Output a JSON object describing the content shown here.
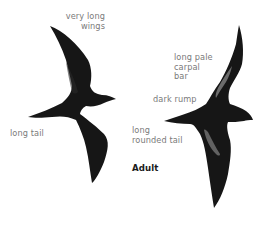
{
  "figure": {
    "caption": "Adult",
    "colors": {
      "background": "#ffffff",
      "bird_body": "#161616",
      "carpal_bar": "#8a8a8a",
      "label_text": "#7a7a7a",
      "caption_text": "#1a1a1a"
    },
    "birds": [
      {
        "view": "upperside-left",
        "labels": {
          "wings": [
            "very long",
            "wings"
          ],
          "tail": "long tail"
        }
      },
      {
        "view": "upperside-right",
        "labels": {
          "carpal": [
            "long pale",
            "carpal",
            "bar"
          ],
          "rump": "dark rump",
          "tail": [
            "long",
            "rounded tail"
          ]
        }
      }
    ]
  }
}
